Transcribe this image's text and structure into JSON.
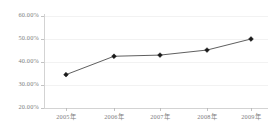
{
  "chart_data": {
    "type": "line",
    "title": "",
    "subtitle": "",
    "xlabel": "",
    "ylabel": "",
    "categories": [
      "2005年",
      "2006年",
      "2007年",
      "2008年",
      "2009年"
    ],
    "series": [
      {
        "name": "",
        "values": [
          34.5,
          42.5,
          43.0,
          45.2,
          50.0
        ]
      }
    ],
    "ylim": [
      20.0,
      60.0
    ],
    "ytick_values": [
      20.0,
      30.0,
      40.0,
      50.0,
      60.0
    ],
    "ytick_labels": [
      "20.00%",
      "30.00%",
      "40.00%",
      "50.00%",
      "60.00%"
    ],
    "xtick_labels": [
      "2005年",
      "2006年",
      "2007年",
      "2008年",
      "2009年"
    ],
    "grid": true,
    "grid_axis": "y",
    "legend": false,
    "legend_position": "none",
    "marker": "diamond",
    "annotations": []
  },
  "style": {
    "background": "#ffffff",
    "grid_color": "#ececed",
    "axis_color": "#c8c8c8",
    "tick_color": "#b4b4b4",
    "line_color": "#4d4d4d",
    "marker_color": "#1a1a1a",
    "label_color": "#808080"
  },
  "geometry": {
    "plot_left": 44,
    "plot_right": 268,
    "plot_top": 16,
    "plot_bottom": 108,
    "point_x": [
      66,
      114,
      160,
      207,
      251
    ],
    "xlabel_y": 114
  }
}
